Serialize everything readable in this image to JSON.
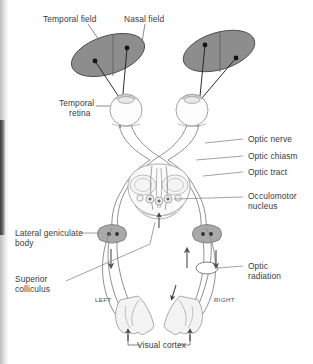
{
  "figure": {
    "type": "anatomical-diagram",
    "background_color": "#ffffff",
    "ink_color": "#6b6b6b",
    "label_color": "#3b3b3b",
    "field_fill_color": "#8c8c8c",
    "geniculate_fill_color": "#a8a8a8",
    "cortex_fill_color": "#efefef"
  },
  "labels": {
    "temporal_field": "Temporal field",
    "nasal_field": "Nasal field",
    "temporal_retina_line1": "Temporal",
    "temporal_retina_line2": "retina",
    "optic_nerve": "Optic nerve",
    "optic_chiasm": "Optic chiasm",
    "optic_tract": "Optic tract",
    "occulomotor_line1": "Occulomotor",
    "occulomotor_line2": "nucleus",
    "lateral_geniculate_line1": "Lateral geniculate",
    "lateral_geniculate_line2": "body",
    "superior_colliculus_line1": "Superior",
    "superior_colliculus_line2": "colliculus",
    "optic_radiation_line1": "Optic",
    "optic_radiation_line2": "radiation",
    "visual_cortex": "Visual cortex",
    "side_left": "LEFT",
    "side_right": "RIGHT"
  },
  "structures": [
    {
      "name": "left-visual-field-ellipse",
      "label": "Left visual field"
    },
    {
      "name": "right-visual-field-ellipse",
      "label": "Right visual field"
    },
    {
      "name": "left-eye",
      "label": "Left eye"
    },
    {
      "name": "right-eye",
      "label": "Right eye"
    },
    {
      "name": "optic-chiasm",
      "label": "Optic chiasm"
    },
    {
      "name": "midbrain",
      "label": "Midbrain"
    },
    {
      "name": "left-lateral-geniculate-body",
      "label": "Left lateral geniculate body"
    },
    {
      "name": "right-lateral-geniculate-body",
      "label": "Right lateral geniculate body"
    },
    {
      "name": "optic-radiation-marker",
      "label": "Optic radiation"
    },
    {
      "name": "left-occipital-cortex",
      "label": "Left visual cortex"
    },
    {
      "name": "right-occipital-cortex",
      "label": "Right visual cortex"
    }
  ]
}
